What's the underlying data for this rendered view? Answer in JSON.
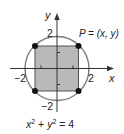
{
  "diagram": {
    "equation": {
      "base_x": "x",
      "exp_x": "2",
      "plus": " + ",
      "base_y": "y",
      "exp_y": "2",
      "rhs": " = 4"
    },
    "point_label": "P = (x, y)",
    "axes": {
      "x_label": "x",
      "y_label": "y",
      "x_ticks": {
        "neg": "−2",
        "pos": "2"
      },
      "y_ticks": {
        "neg": "−2",
        "pos": "2"
      }
    },
    "colors": {
      "square_fill": "#b9b9b9",
      "circle_stroke": "#7a7a7a",
      "axis": "#333333",
      "dot": "#111111"
    }
  }
}
